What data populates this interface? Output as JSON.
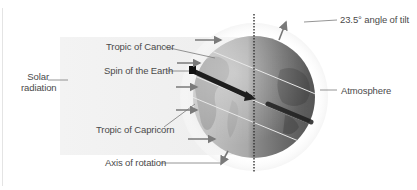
{
  "diagram": {
    "title_clipped": "",
    "labels": {
      "solar_radiation": [
        "Solar",
        "radiation"
      ],
      "tropic_of_cancer": "Tropic of Cancer",
      "spin_of_earth": "Spin of the Earth",
      "tropic_of_capricorn": "Tropic of Capricorn",
      "axis_of_rotation": "Axis of rotation",
      "angle_of_tilt": "23.5° angle of tilt",
      "atmosphere": "Atmosphere"
    },
    "icons": {
      "globe": "earth-globe-icon",
      "radiation_arrows": "arrow-right-icon",
      "spin_arrow": "spin-arrow-icon",
      "axis_arrow": "axis-arrow-icon"
    },
    "colors": {
      "background": "#ffffff",
      "band": "#f0f0f0",
      "globe_light": "#bdbdbd",
      "globe_dark": "#4a4a4a",
      "arrow": "#7a7a7a",
      "spin_arrow": "#1e1e1e",
      "leader_line": "#7a7a7a"
    },
    "tilt_degrees": 23.5
  }
}
